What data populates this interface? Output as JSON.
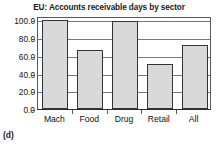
{
  "caption": "(d)",
  "chart_data": {
    "type": "bar",
    "title": "EU: Accounts receivable days by sector",
    "xlabel": "",
    "ylabel": "",
    "categories": [
      "Mach",
      "Food",
      "Drug",
      "Retail",
      "All"
    ],
    "values": [
      101.0,
      67.0,
      99.0,
      51.0,
      72.0
    ],
    "ylim": [
      0.0,
      105.0
    ],
    "yticks": [
      0.0,
      20.0,
      40.0,
      60.0,
      80.0,
      100.0
    ],
    "ytick_labels": [
      "0.0",
      "20.0",
      "40.0",
      "60.0",
      "80.0",
      "100.0"
    ],
    "grid": true,
    "legend": false,
    "colors": {
      "bar_fill": "#d9d9d9",
      "bar_edge": "#333537",
      "axis": "#55585c",
      "gridline": "#76797d",
      "text": "#111111"
    }
  }
}
